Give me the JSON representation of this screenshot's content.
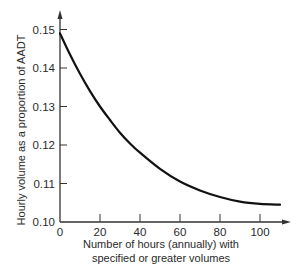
{
  "chart_data": {
    "type": "line",
    "title": "",
    "xlabel": "Number of hours (annually) with specified or greater volumes",
    "xlabel_lines": [
      "Number of hours (annually) with",
      "specified or greater volumes"
    ],
    "ylabel": "Hourly volume as a proportion of AADT",
    "xlim": [
      0,
      115
    ],
    "ylim": [
      0.1,
      0.155
    ],
    "x_ticks": [
      0,
      20,
      40,
      60,
      80,
      100
    ],
    "x_tick_labels": [
      "0",
      "20",
      "40",
      "60",
      "80",
      "100"
    ],
    "y_ticks": [
      0.1,
      0.11,
      0.12,
      0.13,
      0.14,
      0.15
    ],
    "y_tick_labels": [
      "0.10",
      "0.11",
      "0.12",
      "0.13",
      "0.14",
      "0.15"
    ],
    "grid": false,
    "legend": null,
    "series": [
      {
        "name": "Hourly volume proportion",
        "x": [
          0,
          5,
          10,
          15,
          20,
          25,
          30,
          35,
          40,
          50,
          60,
          70,
          80,
          90,
          100,
          110
        ],
        "y": [
          0.149,
          0.1435,
          0.1385,
          0.134,
          0.13,
          0.1265,
          0.1232,
          0.1204,
          0.118,
          0.1138,
          0.1105,
          0.1082,
          0.1065,
          0.1053,
          0.1047,
          0.1045
        ]
      }
    ]
  }
}
